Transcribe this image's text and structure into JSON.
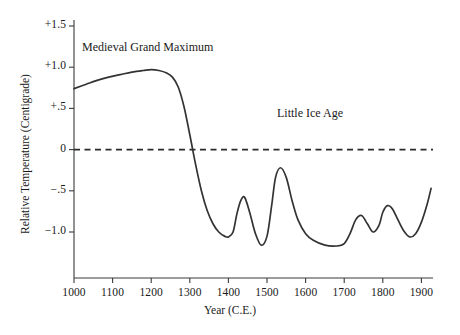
{
  "chart_data": {
    "type": "line",
    "title": "",
    "xlabel": "Year (C.E.)",
    "ylabel": "Relative Temperature (Centigrade)",
    "xlim": [
      1000,
      1930
    ],
    "ylim": [
      -1.35,
      1.6
    ],
    "grid": false,
    "legend": null,
    "y_ticks": [
      1.5,
      1.0,
      0.5,
      0.0,
      -0.5,
      -1.0
    ],
    "y_tick_labels": [
      "+1.5",
      "+1.0",
      "+.5",
      "0",
      "−.5",
      "−1.0"
    ],
    "x_ticks": [
      1000,
      1100,
      1200,
      1300,
      1400,
      1500,
      1600,
      1700,
      1800,
      1900
    ],
    "x_tick_labels": [
      "1000",
      "1100",
      "1200",
      "1300",
      "1400",
      "1500",
      "1600",
      "1700",
      "1800",
      "1900"
    ],
    "reference_lines": [
      {
        "name": "zero-baseline",
        "y": 0.0,
        "style": "dashed"
      }
    ],
    "annotations": [
      {
        "name": "medieval-grand-maximum",
        "text": "Medieval Grand Maximum",
        "x": 1030,
        "y": 1.28
      },
      {
        "name": "little-ice-age",
        "text": "Little Ice Age",
        "x": 1535,
        "y": 0.6
      }
    ],
    "series": [
      {
        "name": "Relative temperature",
        "color": "#333333",
        "x": [
          1000,
          1030,
          1060,
          1090,
          1120,
          1150,
          1180,
          1200,
          1220,
          1240,
          1255,
          1270,
          1285,
          1300,
          1315,
          1330,
          1345,
          1360,
          1375,
          1390,
          1400,
          1412,
          1422,
          1432,
          1442,
          1455,
          1470,
          1485,
          1500,
          1512,
          1522,
          1535,
          1550,
          1565,
          1580,
          1600,
          1620,
          1650,
          1680,
          1700,
          1715,
          1730,
          1745,
          1760,
          1775,
          1790,
          1800,
          1812,
          1825,
          1840,
          1855,
          1870,
          1885,
          1900,
          1915,
          1925
        ],
        "y": [
          0.74,
          0.79,
          0.84,
          0.88,
          0.91,
          0.94,
          0.96,
          0.97,
          0.96,
          0.93,
          0.88,
          0.76,
          0.52,
          0.18,
          -0.18,
          -0.5,
          -0.74,
          -0.9,
          -1.0,
          -1.05,
          -1.06,
          -1.0,
          -0.78,
          -0.62,
          -0.58,
          -0.76,
          -1.02,
          -1.16,
          -1.05,
          -0.68,
          -0.34,
          -0.22,
          -0.34,
          -0.62,
          -0.85,
          -1.02,
          -1.1,
          -1.16,
          -1.17,
          -1.14,
          -1.02,
          -0.85,
          -0.8,
          -0.9,
          -1.0,
          -0.92,
          -0.76,
          -0.68,
          -0.72,
          -0.86,
          -0.99,
          -1.06,
          -1.02,
          -0.88,
          -0.66,
          -0.47
        ]
      }
    ]
  },
  "axes": {
    "y_axis_name": "relative-temperature-axis",
    "x_axis_name": "year-axis"
  }
}
